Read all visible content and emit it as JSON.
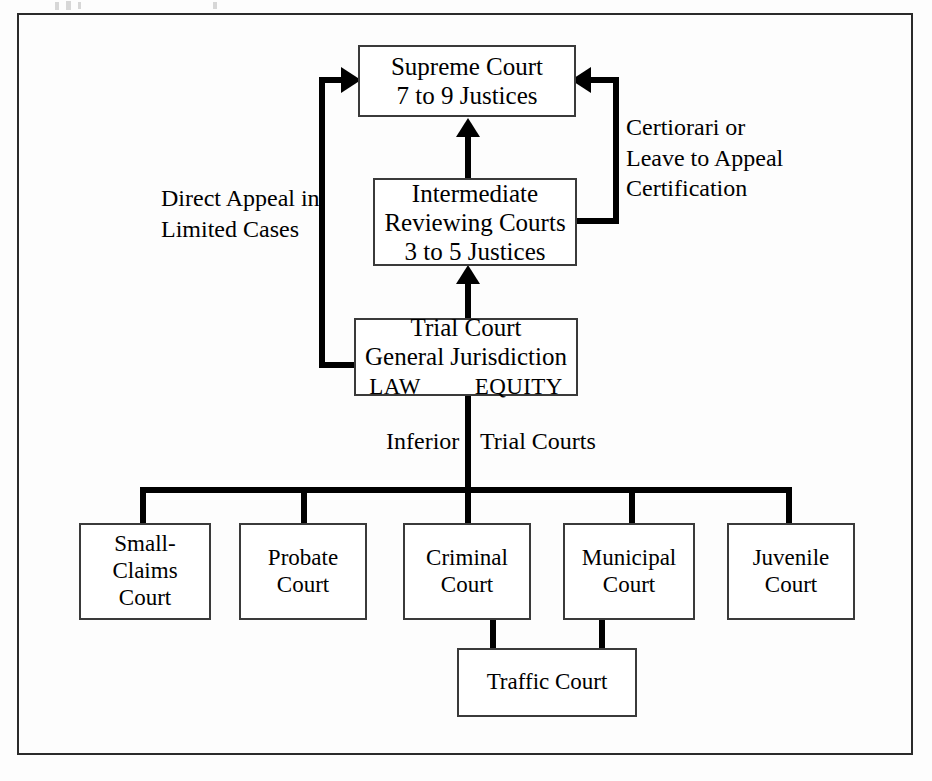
{
  "diagram": {
    "type": "flowchart-hierarchy",
    "colors": {
      "background": "#fdfdfd",
      "box_border": "#3a3a3a",
      "connector": "#000000",
      "frame": "#2b2b2b",
      "text": "#000000"
    },
    "nodes": {
      "supreme_court": {
        "lines": [
          "Supreme Court",
          "7 to 9 Justices"
        ]
      },
      "intermediate_courts": {
        "lines": [
          "Intermediate",
          "Reviewing Courts",
          "3 to 5 Justices"
        ]
      },
      "trial_court": {
        "lines": [
          "Trial Court",
          "General Jurisdiction"
        ],
        "divisions": [
          "LAW",
          "EQUITY"
        ]
      },
      "small_claims_court": {
        "lines": [
          "Small-",
          "Claims",
          "Court"
        ]
      },
      "probate_court": {
        "lines": [
          "Probate",
          "Court"
        ]
      },
      "criminal_court": {
        "lines": [
          "Criminal",
          "Court"
        ]
      },
      "municipal_court": {
        "lines": [
          "Municipal",
          "Court"
        ]
      },
      "juvenile_court": {
        "lines": [
          "Juvenile",
          "Court"
        ]
      },
      "traffic_court": {
        "lines": [
          "Traffic Court"
        ]
      }
    },
    "annotations": {
      "direct_appeal": {
        "lines": [
          "Direct Appeal in",
          "Limited Cases"
        ]
      },
      "certiorari": {
        "lines": [
          "Certiorari or",
          "Leave to Appeal",
          "Certification"
        ]
      },
      "inferior_trial_courts": {
        "left": "Inferior",
        "right": "Trial Courts"
      }
    }
  }
}
